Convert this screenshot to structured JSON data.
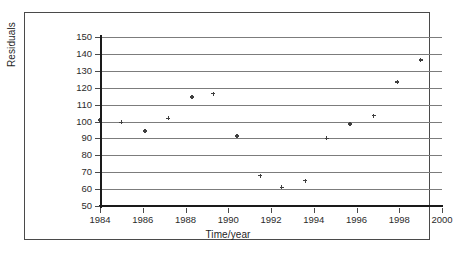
{
  "chart_data": {
    "type": "scatter",
    "title": "",
    "xlabel": "Time/year",
    "ylabel": "Residuals",
    "xlim": [
      1984,
      2000
    ],
    "ylim": [
      50,
      150
    ],
    "xticks": [
      1984,
      1986,
      1988,
      1990,
      1992,
      1994,
      1996,
      1998,
      2000
    ],
    "yticks": [
      50,
      60,
      70,
      80,
      90,
      100,
      110,
      120,
      130,
      140,
      150
    ],
    "grid": "horizontal",
    "legend": "none",
    "marker": "asterisk",
    "series": [
      {
        "name": "Residuals",
        "points": [
          {
            "x": 1984.0,
            "y": 101
          },
          {
            "x": 1985.0,
            "y": 99.5
          },
          {
            "x": 1986.1,
            "y": 94.5
          },
          {
            "x": 1987.2,
            "y": 102
          },
          {
            "x": 1988.3,
            "y": 114.5
          },
          {
            "x": 1989.3,
            "y": 116.5
          },
          {
            "x": 1990.4,
            "y": 91.5
          },
          {
            "x": 1991.5,
            "y": 68
          },
          {
            "x": 1992.5,
            "y": 61
          },
          {
            "x": 1993.6,
            "y": 65
          },
          {
            "x": 1994.6,
            "y": 90
          },
          {
            "x": 1995.7,
            "y": 98.5
          },
          {
            "x": 1996.8,
            "y": 103.5
          },
          {
            "x": 1997.9,
            "y": 123.5
          },
          {
            "x": 1999.0,
            "y": 136.5
          }
        ]
      }
    ]
  },
  "axes": {
    "y_tick_labels": [
      "150",
      "140",
      "130",
      "120",
      "110",
      "100",
      "90",
      "80",
      "70",
      "60",
      "50"
    ],
    "x_tick_labels": [
      "1984",
      "1986",
      "1988",
      "1990",
      "1992",
      "1994",
      "1996",
      "1998",
      "2000"
    ],
    "y_axis_title": "Residuals",
    "x_axis_title": "Time/year"
  },
  "colors": {
    "marker": "#3f3f3f",
    "gridline": "#7c7c7c",
    "axis": "#1a1a1a",
    "frame": "#4a4a4a",
    "background": "#ffffff",
    "text": "#1f1f1f"
  }
}
